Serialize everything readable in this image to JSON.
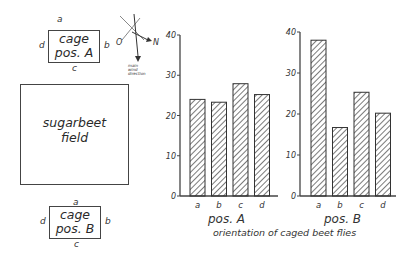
{
  "diagram": {
    "cage_a": {
      "line1": "cage",
      "line2": "pos. A",
      "top": "a",
      "right": "b",
      "bottom": "c",
      "left": "d"
    },
    "cage_b": {
      "line1": "cage",
      "line2": "pos. B",
      "top": "a",
      "right": "b",
      "bottom": "c",
      "left": "d"
    },
    "field": {
      "line1": "sugarbeet",
      "line2": "field"
    },
    "compass": {
      "west": "O",
      "east": "N",
      "wind_label_1": "main",
      "wind_label_2": "wind",
      "wind_label_3": "direction"
    }
  },
  "caption": "orientation of caged beet flies",
  "chart_data": [
    {
      "type": "bar",
      "title": "pos. A",
      "categories": [
        "a",
        "b",
        "c",
        "d"
      ],
      "values": [
        24.0,
        23.3,
        27.9,
        25.2
      ],
      "xlabel": "pos. A",
      "ylabel": "",
      "ylim": [
        0,
        40
      ],
      "yticks": [
        0,
        10,
        20,
        30,
        40
      ],
      "grid": false,
      "bar_fill": "diagonal hatch"
    },
    {
      "type": "bar",
      "title": "pos. B",
      "categories": [
        "a",
        "b",
        "c",
        "d"
      ],
      "values": [
        38.0,
        16.7,
        25.3,
        20.2
      ],
      "xlabel": "pos. B",
      "ylabel": "",
      "ylim": [
        0,
        40
      ],
      "yticks": [
        0,
        10,
        20,
        30,
        40
      ],
      "grid": false,
      "bar_fill": "diagonal hatch"
    }
  ],
  "colors": {
    "ink": "#333333",
    "background": "#ffffff"
  }
}
